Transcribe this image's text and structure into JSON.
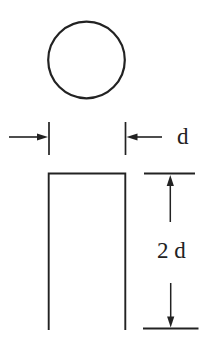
{
  "page": {
    "background": "#ffffff"
  },
  "colors": {
    "line": "#222222",
    "text": "#222222"
  },
  "views": {
    "top_view": {
      "shape": "circle"
    },
    "front_view": {
      "shape": "rectangle-open-bottom"
    }
  },
  "dimensions": {
    "diameter": {
      "label": "d"
    },
    "height": {
      "label": "2 d"
    }
  }
}
